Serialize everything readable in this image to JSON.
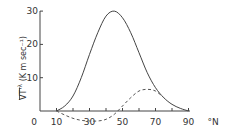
{
  "chart_data": {
    "type": "line",
    "title": "",
    "xlabel": "°N",
    "ylabel": "VT'^λ (K m sec⁻¹)",
    "xlim": [
      0,
      90
    ],
    "ylim": [
      -4,
      30
    ],
    "grid": false,
    "x_ticks": [
      "0",
      "10",
      "30",
      "50",
      "70",
      "90"
    ],
    "y_ticks": [
      "10",
      "20",
      "30"
    ],
    "x_unit_label": "°N",
    "series": [
      {
        "name": "total (solid)",
        "style": "solid",
        "x": [
          10,
          15,
          20,
          25,
          30,
          35,
          40,
          45,
          50,
          55,
          60,
          65,
          70,
          75,
          80,
          85,
          90
        ],
        "values": [
          0,
          1.5,
          4.5,
          10,
          17,
          23.5,
          28.5,
          30,
          28,
          23.5,
          17.5,
          11.5,
          7,
          4,
          2,
          0.8,
          0
        ]
      },
      {
        "name": "component (dashed)",
        "style": "dashed",
        "x": [
          10,
          15,
          20,
          25,
          30,
          35,
          40,
          45,
          50,
          55,
          60,
          65,
          70,
          75
        ],
        "values": [
          0,
          -1.2,
          -2.2,
          -2.8,
          -3,
          -3,
          -2.5,
          -1,
          1.5,
          4,
          6,
          6.5,
          6,
          4
        ]
      }
    ]
  },
  "axes": {
    "y_label_main": "VT'",
    "y_label_super": "λ",
    "y_label_units": "(K m sec⁻¹)",
    "x_unit": "°N"
  }
}
